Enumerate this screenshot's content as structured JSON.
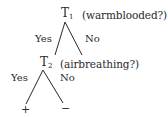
{
  "diagram": {
    "type": "decision-tree",
    "nodes": [
      {
        "id": "T1",
        "label": "T",
        "subscript": "1",
        "question": "(warmblooded?)"
      },
      {
        "id": "T2",
        "label": "T",
        "subscript": "2",
        "question": "(airbreathing?)"
      },
      {
        "id": "leaf_plus",
        "label": "+"
      },
      {
        "id": "leaf_minus",
        "label": "−"
      }
    ],
    "edges": [
      {
        "from": "T1",
        "to": "T2",
        "label": "Yes"
      },
      {
        "from": "T1",
        "to": "none",
        "label": "No"
      },
      {
        "from": "T2",
        "to": "leaf_plus",
        "label": "Yes"
      },
      {
        "from": "T2",
        "to": "leaf_minus",
        "label": "No"
      }
    ],
    "line_color": "#2a2a2a"
  }
}
